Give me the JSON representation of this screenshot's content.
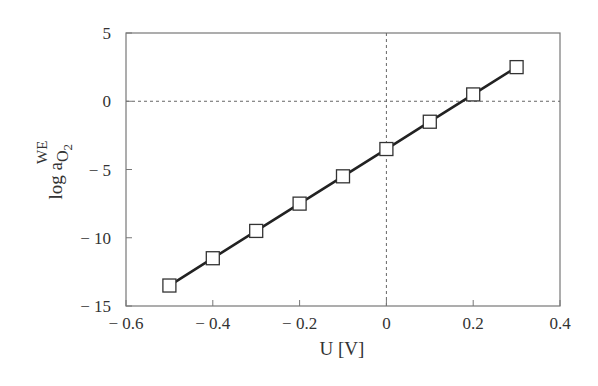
{
  "chart_data": {
    "type": "line",
    "title": "",
    "xlabel": "U [V]",
    "ylabel": "log a_O2^WE",
    "ylabel_parts": {
      "main": "log a",
      "sub": "O",
      "sub2": "2",
      "sup": "WE"
    },
    "xlim": [
      -0.6,
      0.4
    ],
    "ylim": [
      -15,
      5
    ],
    "xticks": [
      -0.6,
      -0.4,
      -0.2,
      0,
      0.2,
      0.4
    ],
    "xtick_labels": [
      "− 0.6",
      "− 0.4",
      "− 0.2",
      "0",
      "0.2",
      "0.4"
    ],
    "yticks": [
      5,
      0,
      -5,
      -10,
      -15
    ],
    "ytick_labels": [
      "5",
      "0",
      "− 5",
      "− 10",
      "− 15"
    ],
    "grid": false,
    "reference_lines": {
      "x": 0,
      "y": 0,
      "style": "dotted"
    },
    "legend": null,
    "marker": "open-square",
    "series": [
      {
        "name": "log a_O2^WE vs U",
        "x": [
          -0.5,
          -0.4,
          -0.3,
          -0.2,
          -0.1,
          0.0,
          0.1,
          0.2,
          0.3
        ],
        "y": [
          -13.5,
          -11.5,
          -9.5,
          -7.5,
          -5.5,
          -3.5,
          -1.5,
          0.5,
          2.5
        ]
      }
    ]
  }
}
